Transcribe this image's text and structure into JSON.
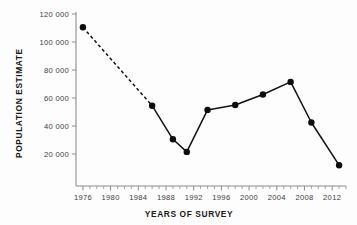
{
  "chart_data": {
    "type": "line",
    "title": "",
    "xlabel": "YEARS OF SURVEY",
    "ylabel": "POPULATION ESTIMATE",
    "xlim": [
      1975,
      2014
    ],
    "ylim": [
      0,
      120000
    ],
    "grid": false,
    "legend": null,
    "x_tick_labels": [
      "1976",
      "1980",
      "1984",
      "1988",
      "1992",
      "1996",
      "2000",
      "2004",
      "2008",
      "2012"
    ],
    "x_tick_values": [
      1976,
      1980,
      1984,
      1988,
      1992,
      1996,
      2000,
      2004,
      2008,
      2012
    ],
    "x_minor_tick_step": 1,
    "y_tick_labels": [
      "20 000",
      "40 000",
      "60 000",
      "80 000",
      "100 000",
      "120 000"
    ],
    "y_tick_values": [
      20000,
      40000,
      60000,
      80000,
      100000,
      120000
    ],
    "series": [
      {
        "name": "Population estimate",
        "marker": "filled-circle",
        "color": "#0d0d0d",
        "x": [
          1976,
          1986,
          1989,
          1991,
          1994,
          1998,
          2002,
          2006,
          2009,
          2013
        ],
        "values": [
          110500,
          54500,
          30500,
          21500,
          51500,
          55000,
          62500,
          71500,
          42500,
          12000
        ],
        "segments": [
          {
            "from_index": 0,
            "to_index": 1,
            "style": "dashed"
          },
          {
            "from_index": 1,
            "to_index": 9,
            "style": "solid"
          }
        ]
      }
    ],
    "annotations": []
  },
  "axis": {
    "y_title": "POPULATION ESTIMATE",
    "x_title": "YEARS OF SURVEY"
  },
  "colors": {
    "ink": "#111111",
    "axis": "#8c8c8c",
    "background": "#fdfdfd"
  }
}
